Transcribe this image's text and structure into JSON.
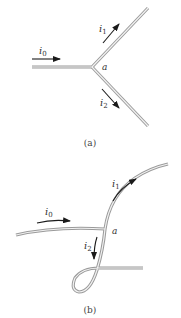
{
  "figure": {
    "panels": [
      {
        "caption": "(a)",
        "node_label": "a",
        "currents": [
          {
            "name": "i",
            "sub": "0"
          },
          {
            "name": "i",
            "sub": "1"
          },
          {
            "name": "i",
            "sub": "2"
          }
        ]
      },
      {
        "caption": "(b)",
        "node_label": "a",
        "currents": [
          {
            "name": "i",
            "sub": "0"
          },
          {
            "name": "i",
            "sub": "1"
          },
          {
            "name": "i",
            "sub": "2"
          }
        ]
      }
    ],
    "colors": {
      "wire_outer": "#9a9a9a",
      "wire_inner": "#f2f2f2",
      "arrow": "#1a1a1a",
      "text": "#333333"
    }
  }
}
